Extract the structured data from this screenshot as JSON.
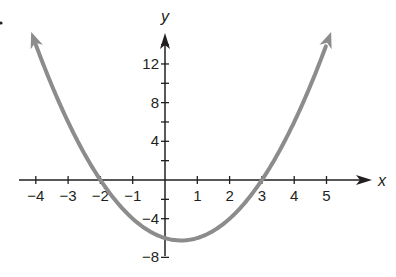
{
  "chart_data": {
    "type": "line",
    "title": "",
    "function": "y = x^2 - x - 6",
    "xlabel": "x",
    "ylabel": "y",
    "xlim": [
      -4.5,
      5.5
    ],
    "ylim": [
      -9,
      16
    ],
    "x_ticks": [
      -4,
      -3,
      -2,
      -1,
      1,
      2,
      3,
      4,
      5
    ],
    "x_tick_labels": [
      "−4",
      "−3",
      "−2",
      "−1",
      "1",
      "2",
      "3",
      "4",
      "5"
    ],
    "y_ticks": [
      12,
      8,
      4,
      -4,
      -8
    ],
    "y_tick_labels": [
      "12",
      "8",
      "4",
      "−4",
      "−8"
    ],
    "y_minor_ticks": [
      14,
      10,
      6,
      2,
      -2,
      -6
    ],
    "grid": false,
    "series": [
      {
        "name": "parabola",
        "color": "#8c8c8c",
        "x": [
          -4.1,
          -4,
          -3,
          -2,
          -1,
          0,
          0.5,
          1,
          2,
          3,
          4,
          5,
          5.1
        ],
        "y": [
          14.91,
          14,
          6,
          0,
          -4,
          -6,
          -6.25,
          -6,
          -4,
          0,
          6,
          14,
          14.91
        ]
      }
    ],
    "key_points": {
      "x_intercepts": [
        -2,
        3
      ],
      "y_intercept": -6,
      "vertex": [
        0.5,
        -6.25
      ]
    }
  },
  "colors": {
    "axis": "#231f20",
    "curve": "#8c8c8c"
  }
}
